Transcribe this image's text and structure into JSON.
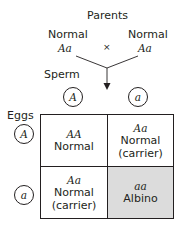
{
  "title": "Parents",
  "parents": {
    "left": {
      "phenotype": "Normal",
      "genotype": "Aa"
    },
    "right": {
      "phenotype": "Normal",
      "genotype": "Aa"
    },
    "cross_symbol": "×"
  },
  "sperm": {
    "label": "Sperm",
    "alleles": [
      "A",
      "a"
    ]
  },
  "eggs": {
    "label": "Eggs",
    "alleles": [
      "A",
      "a"
    ]
  },
  "cells": [
    {
      "genotype": "AA",
      "phenotype": "Normal",
      "note": ""
    },
    {
      "genotype": "Aa",
      "phenotype": "Normal",
      "note": "(carrier)"
    },
    {
      "genotype": "Aa",
      "phenotype": "Normal",
      "note": "(carrier)"
    },
    {
      "genotype": "aa",
      "phenotype": "Albino",
      "note": ""
    }
  ],
  "colors": {
    "albino_cell": "#dcdcdc",
    "line": "#231f20"
  }
}
